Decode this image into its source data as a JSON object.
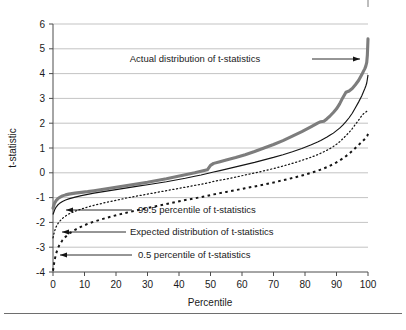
{
  "figure": {
    "background": "#ffffff",
    "corner_mark": "crop-mark"
  },
  "chart_data": {
    "type": "line",
    "title": "",
    "xlabel": "Percentile",
    "ylabel": "t-statistic",
    "xlim": [
      0,
      100
    ],
    "ylim": [
      -4,
      6
    ],
    "xticks": [
      0,
      10,
      20,
      30,
      40,
      50,
      60,
      70,
      80,
      90,
      100
    ],
    "yticks": [
      -4,
      -3,
      -2,
      -1,
      0,
      1,
      2,
      3,
      4,
      5,
      6
    ],
    "xtick_labels": [
      "0",
      "10",
      "20",
      "30",
      "40",
      "50",
      "60",
      "70",
      "80",
      "90",
      "100"
    ],
    "ytick_labels": [
      "-4",
      "-3",
      "-2",
      "-1",
      "0",
      "1",
      "2",
      "3",
      "4",
      "5",
      "6"
    ],
    "grid": "horizontal",
    "legend_position": "inline-annotations",
    "colors": {
      "actual": "#7d7d7d",
      "expected": "#141414",
      "p995": "#141414",
      "p005": "#141414"
    },
    "x": [
      0,
      0.5,
      1,
      1.5,
      2,
      3,
      4,
      5,
      7,
      9,
      11,
      13,
      15,
      18,
      21,
      24,
      27,
      30,
      33,
      36,
      39,
      42,
      45,
      47,
      49,
      50,
      51,
      53,
      55,
      58,
      61,
      64,
      67,
      70,
      73,
      76,
      79,
      82,
      84,
      85,
      86,
      87,
      88,
      89,
      90,
      91,
      92,
      93,
      94,
      95,
      96,
      97,
      98,
      98.5,
      99,
      99.3,
      99.6,
      99.8,
      100
    ],
    "series": [
      {
        "name": "Actual distribution of t-statistics",
        "style": "thick-gray-solid",
        "values": [
          -1.43,
          -1.22,
          -1.12,
          -1.05,
          -1.0,
          -0.93,
          -0.89,
          -0.86,
          -0.82,
          -0.79,
          -0.76,
          -0.72,
          -0.68,
          -0.62,
          -0.56,
          -0.5,
          -0.44,
          -0.38,
          -0.31,
          -0.24,
          -0.16,
          -0.08,
          0.0,
          0.06,
          0.12,
          0.3,
          0.38,
          0.45,
          0.52,
          0.62,
          0.73,
          0.86,
          1.0,
          1.14,
          1.3,
          1.48,
          1.66,
          1.86,
          2.0,
          2.06,
          2.08,
          2.18,
          2.3,
          2.43,
          2.58,
          2.78,
          3.03,
          3.25,
          3.3,
          3.4,
          3.55,
          3.72,
          3.95,
          4.08,
          4.2,
          4.3,
          4.45,
          4.75,
          5.4
        ]
      },
      {
        "name": "Expected distribution of t-statistics",
        "style": "thin-black-solid",
        "values": [
          -1.68,
          -1.5,
          -1.38,
          -1.3,
          -1.24,
          -1.16,
          -1.1,
          -1.05,
          -0.98,
          -0.92,
          -0.87,
          -0.82,
          -0.78,
          -0.72,
          -0.66,
          -0.6,
          -0.54,
          -0.48,
          -0.42,
          -0.36,
          -0.29,
          -0.22,
          -0.14,
          -0.09,
          -0.03,
          0.0,
          0.03,
          0.09,
          0.15,
          0.24,
          0.33,
          0.42,
          0.52,
          0.62,
          0.73,
          0.85,
          0.98,
          1.13,
          1.24,
          1.3,
          1.37,
          1.44,
          1.52,
          1.6,
          1.7,
          1.8,
          1.92,
          2.06,
          2.22,
          2.4,
          2.62,
          2.85,
          3.1,
          3.25,
          3.4,
          3.5,
          3.62,
          3.78,
          3.95
        ]
      },
      {
        "name": "99.5 percentile of t-statistics",
        "style": "fine-dotted",
        "values": [
          -2.62,
          -2.35,
          -2.18,
          -2.06,
          -1.97,
          -1.84,
          -1.74,
          -1.66,
          -1.55,
          -1.46,
          -1.38,
          -1.31,
          -1.25,
          -1.16,
          -1.08,
          -1.0,
          -0.93,
          -0.86,
          -0.79,
          -0.72,
          -0.65,
          -0.58,
          -0.51,
          -0.46,
          -0.41,
          -0.38,
          -0.35,
          -0.3,
          -0.25,
          -0.17,
          -0.09,
          -0.01,
          0.08,
          0.17,
          0.27,
          0.38,
          0.5,
          0.63,
          0.73,
          0.79,
          0.85,
          0.91,
          0.98,
          1.06,
          1.15,
          1.25,
          1.37,
          1.5,
          1.63,
          1.78,
          1.95,
          2.12,
          2.3,
          2.37,
          2.42,
          2.45,
          2.48,
          2.5,
          2.52
        ]
      },
      {
        "name": "0.5 percentile of t-statistics",
        "style": "coarse-dashed",
        "values": [
          -3.95,
          -3.52,
          -3.25,
          -3.06,
          -2.92,
          -2.72,
          -2.58,
          -2.46,
          -2.3,
          -2.17,
          -2.06,
          -1.97,
          -1.89,
          -1.78,
          -1.68,
          -1.59,
          -1.5,
          -1.42,
          -1.34,
          -1.26,
          -1.18,
          -1.1,
          -1.03,
          -0.98,
          -0.93,
          -0.9,
          -0.87,
          -0.82,
          -0.77,
          -0.7,
          -0.62,
          -0.55,
          -0.47,
          -0.39,
          -0.3,
          -0.21,
          -0.11,
          0.0,
          0.08,
          0.13,
          0.18,
          0.23,
          0.29,
          0.35,
          0.42,
          0.5,
          0.58,
          0.67,
          0.77,
          0.88,
          1.0,
          1.12,
          1.24,
          1.3,
          1.36,
          1.4,
          1.45,
          1.5,
          1.57
        ]
      }
    ],
    "annotations": [
      {
        "id": "actual",
        "text": "Actual distribution of t-statistics",
        "text_x": 195,
        "text_y": 62,
        "anchor": "middle",
        "leader_from_x": 312,
        "leader_from_y": 59,
        "leader_to_x": 360,
        "leader_to_y": 59,
        "arrow": "right"
      },
      {
        "id": "p995",
        "text": "99.5 percentile of t-statistics",
        "text_x": 138,
        "text_y": 213,
        "anchor": "start",
        "leader_from_x": 132,
        "leader_from_y": 210,
        "leader_to_x": 66,
        "leader_to_y": 210,
        "arrow": "left"
      },
      {
        "id": "expected",
        "text": "Expected distribution of t-statistics",
        "text_x": 130,
        "text_y": 235,
        "anchor": "start",
        "leader_from_x": 126,
        "leader_from_y": 232,
        "leader_to_x": 62,
        "leader_to_y": 232,
        "arrow": "left"
      },
      {
        "id": "p005",
        "text": "0.5 percentile of t-statistics",
        "text_x": 138,
        "text_y": 258,
        "anchor": "start",
        "leader_from_x": 132,
        "leader_from_y": 255,
        "leader_to_x": 60,
        "leader_to_y": 255,
        "arrow": "left"
      }
    ]
  }
}
